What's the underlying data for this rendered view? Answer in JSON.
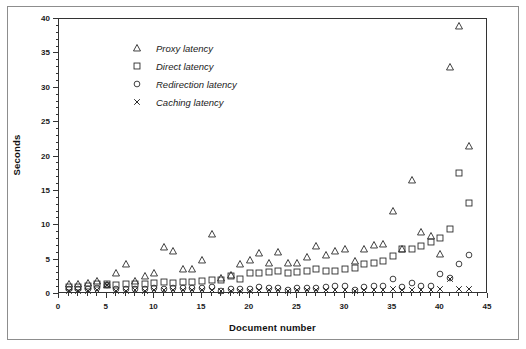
{
  "chart_data": {
    "type": "scatter",
    "title": "",
    "xlabel": "Document number",
    "ylabel": "Seconds",
    "xlim": [
      0,
      45
    ],
    "ylim": [
      0,
      40
    ],
    "x_major_step": 5,
    "x_minor_step": 1,
    "y_major_step": 5,
    "y_minor_step": 1,
    "grid": false,
    "legend_position": "upper-left-inside",
    "x_tick_labels": [
      "0",
      "5",
      "10",
      "15",
      "20",
      "25",
      "30",
      "35",
      "40",
      "45"
    ],
    "y_tick_labels": [
      "0",
      "5",
      "10",
      "15",
      "20",
      "25",
      "30",
      "35",
      "40"
    ],
    "x": [
      1,
      2,
      3,
      4,
      5,
      6,
      7,
      8,
      9,
      10,
      11,
      12,
      13,
      14,
      15,
      16,
      17,
      18,
      19,
      20,
      21,
      22,
      23,
      24,
      25,
      26,
      27,
      28,
      29,
      30,
      31,
      32,
      33,
      34,
      35,
      36,
      37,
      38,
      39,
      40,
      41,
      42,
      43
    ],
    "series": [
      {
        "name": "Proxy latency",
        "marker": "triangle",
        "color": "#333333",
        "values": [
          1.4,
          1.5,
          1.6,
          1.9,
          1.3,
          3.1,
          4.3,
          1.9,
          2.6,
          3.0,
          6.8,
          6.2,
          3.6,
          3.6,
          4.9,
          8.8,
          2.3,
          2.7,
          4.4,
          5.0,
          6.0,
          4.5,
          6.1,
          4.5,
          4.5,
          5.4,
          7.0,
          5.7,
          6.2,
          6.5,
          4.8,
          6.5,
          7.1,
          7.3,
          12.1,
          6.6,
          16.6,
          9.0,
          8.5,
          5.8,
          33.0,
          39.0,
          21.6
        ]
      },
      {
        "name": "Direct latency",
        "marker": "square",
        "color": "#333333",
        "values": [
          1.0,
          1.0,
          1.1,
          1.4,
          1.4,
          1.3,
          1.4,
          1.5,
          1.4,
          1.6,
          1.7,
          1.6,
          1.8,
          1.8,
          1.9,
          2.1,
          2.0,
          2.6,
          2.2,
          3.0,
          3.1,
          3.2,
          3.3,
          3.1,
          3.2,
          3.4,
          3.7,
          3.3,
          3.4,
          3.6,
          3.8,
          4.4,
          4.5,
          4.8,
          5.5,
          6.6,
          6.5,
          7.0,
          7.5,
          8.2,
          9.4,
          17.6,
          13.3
        ]
      },
      {
        "name": "Redirection latency",
        "marker": "circle",
        "color": "#333333",
        "values": [
          0.7,
          0.7,
          0.8,
          0.9,
          1.3,
          0.8,
          0.8,
          0.8,
          0.8,
          0.9,
          0.8,
          0.9,
          0.9,
          0.9,
          0.9,
          1.0,
          0.5,
          0.7,
          0.7,
          0.8,
          1.0,
          0.9,
          0.9,
          0.6,
          0.9,
          0.9,
          0.9,
          1.0,
          1.1,
          1.1,
          0.6,
          1.0,
          1.1,
          1.2,
          2.2,
          1.0,
          1.6,
          1.2,
          1.2,
          2.9,
          2.3,
          4.4,
          5.7
        ]
      },
      {
        "name": "Caching latency",
        "marker": "cross",
        "color": "#333333",
        "values": [
          0.5,
          0.5,
          0.5,
          0.6,
          1.3,
          0.5,
          0.5,
          0.6,
          0.5,
          0.6,
          0.6,
          0.6,
          0.6,
          0.6,
          0.6,
          0.6,
          0.4,
          0.5,
          0.5,
          0.5,
          0.6,
          0.6,
          0.6,
          0.5,
          0.6,
          0.6,
          0.6,
          0.6,
          0.6,
          0.6,
          0.5,
          0.6,
          0.6,
          0.6,
          0.7,
          0.6,
          0.6,
          0.6,
          0.6,
          0.7,
          2.2,
          0.8,
          0.8
        ]
      }
    ]
  },
  "legend": {
    "items": [
      {
        "label": "Proxy latency",
        "marker": "triangle"
      },
      {
        "label": "Direct latency",
        "marker": "square"
      },
      {
        "label": "Redirection latency",
        "marker": "circle"
      },
      {
        "label": "Caching latency",
        "marker": "cross"
      }
    ]
  }
}
